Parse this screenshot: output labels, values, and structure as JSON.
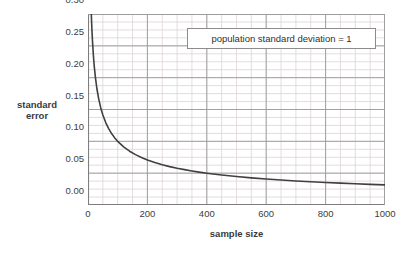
{
  "chart_data": {
    "type": "line",
    "title": "",
    "xlabel": "sample size",
    "ylabel": "standard error",
    "ylabel_lines": [
      "standard",
      "error"
    ],
    "xlim": [
      0,
      1000
    ],
    "ylim": [
      0.0,
      0.3
    ],
    "xticks": [
      0,
      200,
      400,
      600,
      800,
      1000
    ],
    "xtick_labels": [
      "0",
      "200",
      "400",
      "600",
      "800",
      "1000"
    ],
    "yticks": [
      0.0,
      0.05,
      0.1,
      0.15,
      0.2,
      0.25,
      0.3
    ],
    "ytick_labels": [
      "0.00",
      "0.05",
      "0.10",
      "0.15",
      "0.20",
      "0.25",
      "0.30"
    ],
    "grid": true,
    "grid_major_color": "#9a9a9a",
    "grid_minor_color": "#ddd3d6",
    "x_minor_step": 50,
    "y_minor_step": 0.0125,
    "legend": "none",
    "annotations": [
      {
        "text": "population standard deviation = 1",
        "x": 420,
        "y": 0.272
      }
    ],
    "series": [
      {
        "name": "standard error",
        "formula": "1/sqrt(n)",
        "line_color": "#404040",
        "line_width": 1.6,
        "x": [
          9,
          11,
          13,
          15,
          18,
          21,
          25,
          30,
          36,
          43,
          50,
          60,
          70,
          80,
          90,
          100,
          120,
          140,
          160,
          180,
          200,
          225,
          250,
          275,
          300,
          325,
          350,
          375,
          400,
          450,
          500,
          550,
          600,
          650,
          700,
          750,
          800,
          850,
          900,
          950,
          1000
        ],
        "y": [
          0.3333,
          0.3015,
          0.2774,
          0.2582,
          0.2357,
          0.2182,
          0.2,
          0.1826,
          0.1667,
          0.1525,
          0.1414,
          0.1291,
          0.1195,
          0.1118,
          0.1054,
          0.1,
          0.0913,
          0.0845,
          0.0791,
          0.0745,
          0.0707,
          0.0667,
          0.0632,
          0.0603,
          0.0577,
          0.0555,
          0.0535,
          0.0516,
          0.05,
          0.0471,
          0.0447,
          0.0426,
          0.0408,
          0.0392,
          0.0378,
          0.0365,
          0.0354,
          0.0343,
          0.0333,
          0.0324,
          0.0316
        ]
      }
    ]
  },
  "plot_geometry": {
    "left": 88,
    "top": 14,
    "width": 297,
    "height": 191
  }
}
